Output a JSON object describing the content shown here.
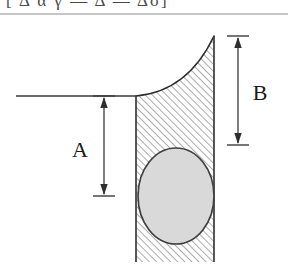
{
  "figure": {
    "title_fragment": "[  Δ α γ — Δ — Δσ]",
    "background_color": "#ffffff",
    "ink_color": "#3a3a3a",
    "hatch_color": "#4a4a4a",
    "bubble_fill_color": "#d9d9d9",
    "bubble_stroke_color": "#404040",
    "header_rule_color": "#8c8c8c",
    "dimensions": [
      {
        "id": "A",
        "label": "A",
        "orientation": "vertical",
        "arrow_x": 104,
        "top_y": 96,
        "bottom_y": 196,
        "label_x": 80,
        "label_y": 152,
        "tick_half_width": 11,
        "description": "depth from flat liquid surface to lower reference"
      },
      {
        "id": "B",
        "label": "B",
        "orientation": "vertical",
        "arrow_x": 238,
        "top_y": 36,
        "bottom_y": 145,
        "label_x": 252,
        "label_y": 95,
        "tick_half_width": 11,
        "description": "capillary rise height along right wall"
      }
    ],
    "geometry": {
      "surface_line": {
        "x1": 16,
        "y1": 96,
        "x2": 136,
        "y2": 96
      },
      "left_wall": {
        "x": 136,
        "y1": 96,
        "y2": 262
      },
      "right_wall": {
        "x": 214,
        "y1": 36,
        "y2": 262
      },
      "meniscus_curve": "M 136 96 C 170 93 196 74 214 36",
      "hatched_region": "M 136 96 C 170 93 196 74 214 36 L 214 262 L 136 262 Z",
      "bubble_ellipse": {
        "cx": 176,
        "cy": 196,
        "rx": 38,
        "ry": 48
      },
      "header_rule": {
        "x1": 0,
        "y1": 14,
        "x2": 288,
        "y2": 14
      },
      "hatch_angle_deg": 45,
      "hatch_spacing_px": 5
    }
  }
}
